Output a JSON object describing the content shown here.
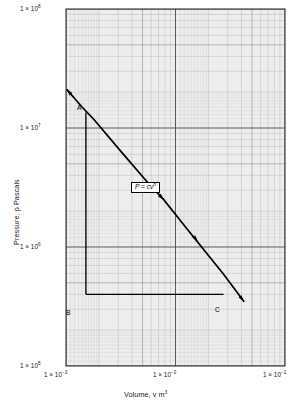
{
  "chart_data": {
    "type": "line",
    "title": "",
    "subtitle": "",
    "xlabel": "Volume, v m",
    "xlabel_sup": "3",
    "ylabel": "Pressure, p Pascals",
    "xscale": "log",
    "yscale": "log",
    "xlim": [
      0.001,
      0.1
    ],
    "ylim": [
      100000,
      100000000
    ],
    "grid": "log-log minor and major gridlines, both axes",
    "legend": "none",
    "xticks": [
      {
        "value": 0.001,
        "label_mantissa": "1 × 10",
        "label_exp": "−3"
      },
      {
        "value": 0.01,
        "label_mantissa": "1 × 10",
        "label_exp": "−2"
      },
      {
        "value": 0.1,
        "label_mantissa": "1 × 10",
        "label_exp": "−1"
      }
    ],
    "yticks": [
      {
        "value": 100000000,
        "label_mantissa": "1 × 10",
        "label_exp": "8"
      },
      {
        "value": 10000000,
        "label_mantissa": "1 × 10",
        "label_exp": "7"
      },
      {
        "value": 1000000,
        "label_mantissa": "1 × 10",
        "label_exp": "6"
      },
      {
        "value": 100000,
        "label_mantissa": "1 × 10",
        "label_exp": "5"
      }
    ],
    "series": [
      {
        "name": "P = cv^n",
        "type": "line",
        "style": "straight line on log-log axes, arrowheads at both ends",
        "x": [
          0.00102,
          0.0014,
          0.0018,
          0.0032,
          0.0057,
          0.0078,
          0.0125,
          0.0215,
          0.0275,
          0.042
        ],
        "y": [
          21000000,
          15000000,
          11800000,
          6300000,
          3400000,
          2500000,
          1450000,
          780000,
          590000,
          350000
        ]
      },
      {
        "name": "construction-BC",
        "type": "line",
        "style": "horizontal construction line from B to C",
        "x": [
          0.00152,
          0.0275
        ],
        "y": [
          400000,
          400000
        ]
      },
      {
        "name": "construction-AB",
        "type": "line",
        "style": "vertical construction line from A down to B",
        "x": [
          0.00152,
          0.00152
        ],
        "y": [
          13500000,
          400000
        ]
      }
    ],
    "annotations": [
      {
        "name": "point-A",
        "label": "A",
        "x": 0.00152,
        "y": 13500000
      },
      {
        "name": "point-B",
        "label": "B",
        "x": 0.00152,
        "y": 400000
      },
      {
        "name": "point-C",
        "label": "C",
        "x": 0.0275,
        "y": 400000
      },
      {
        "name": "equation",
        "label_main": "P = cv",
        "label_sup": "n",
        "x": 0.0063,
        "y": 2600000
      }
    ]
  },
  "colors": {
    "plot_line": "#000000",
    "grid_major": "#555555",
    "grid_minor": "#b0b0b0",
    "frame": "#333333",
    "background": "#ffffff",
    "panel_tint": "#ebebeb",
    "text": "#1a1a1a"
  }
}
